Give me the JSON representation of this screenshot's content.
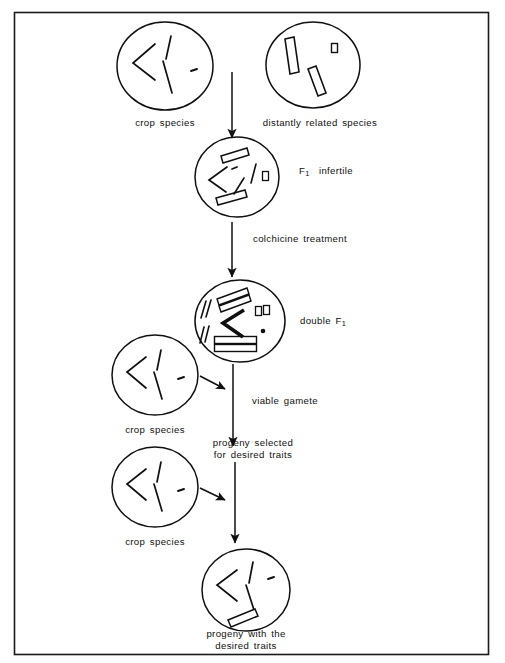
{
  "figure": {
    "kind": "wide-hybridization-breeding-diagram",
    "frame_color": "#1a1a1a",
    "ink_color": "#101010",
    "background": "#ffffff"
  },
  "labels": {
    "crop_species_top": "crop  species",
    "distantly_related_species": "distantly  related  species",
    "f1_infertile": "F",
    "f1_infertile_sub": "1",
    "f1_infertile_rest": "infertile",
    "colchicine_treatment": "colchicine  treatment",
    "double_f1": "double  F",
    "double_f1_sub": "1",
    "viable_gamete": "viable  gamete",
    "progeny_selected_line1": "progeny  selected",
    "progeny_selected_line2": "for  desired  traits",
    "crop_species_mid": "crop  species",
    "crop_species_lower": "crop  species",
    "progeny_with_line1": "progeny  with  the",
    "progeny_with_line2": "desired  traits"
  },
  "cells": [
    {
      "id": "crop-species-top",
      "label": "crop  species",
      "cx": 165,
      "cy": 66,
      "rx": 48,
      "ry": 44,
      "chromosomes": "thin-line-set"
    },
    {
      "id": "distantly-related-species",
      "label": "distantly  related  species",
      "cx": 313,
      "cy": 65,
      "rx": 47,
      "ry": 43,
      "chromosomes": "hollow-rod-set"
    },
    {
      "id": "f1-infertile",
      "label": "F1  infertile",
      "cx": 237,
      "cy": 177,
      "rx": 42,
      "ry": 40,
      "chromosomes": "mixed-set"
    },
    {
      "id": "double-f1",
      "label": "double  F1",
      "cx": 240,
      "cy": 321,
      "rx": 45,
      "ry": 41,
      "chromosomes": "doubled-set"
    },
    {
      "id": "crop-species-mid",
      "label": "crop  species",
      "cx": 155,
      "cy": 375,
      "rx": 43,
      "ry": 40,
      "chromosomes": "thin-line-set"
    },
    {
      "id": "crop-species-lower",
      "label": "crop  species",
      "cx": 155,
      "cy": 487,
      "rx": 43,
      "ry": 40,
      "chromosomes": "thin-line-set"
    },
    {
      "id": "progeny-with-desired-traits",
      "label": "progeny  with  the  desired  traits",
      "cx": 246,
      "cy": 590,
      "rx": 44,
      "ry": 41,
      "chromosomes": "thin-line-set-plus-rod"
    }
  ],
  "arrows": [
    {
      "id": "cross-to-f1",
      "from": [
        232,
        72
      ],
      "to": [
        232,
        140
      ]
    },
    {
      "id": "f1-to-colchicine",
      "from": [
        232,
        222
      ],
      "to": [
        232,
        279
      ]
    },
    {
      "id": "doublef1-to-progeny",
      "from": [
        233,
        365
      ],
      "to": [
        233,
        448
      ]
    },
    {
      "id": "gamete-to-main-1",
      "from": [
        199,
        374
      ],
      "to": [
        226,
        389
      ]
    },
    {
      "id": "progeny-to-main-2",
      "from": [
        199,
        486
      ],
      "to": [
        226,
        500
      ]
    },
    {
      "id": "progeny-to-final",
      "from": [
        235,
        463
      ],
      "to": [
        235,
        545
      ]
    }
  ]
}
